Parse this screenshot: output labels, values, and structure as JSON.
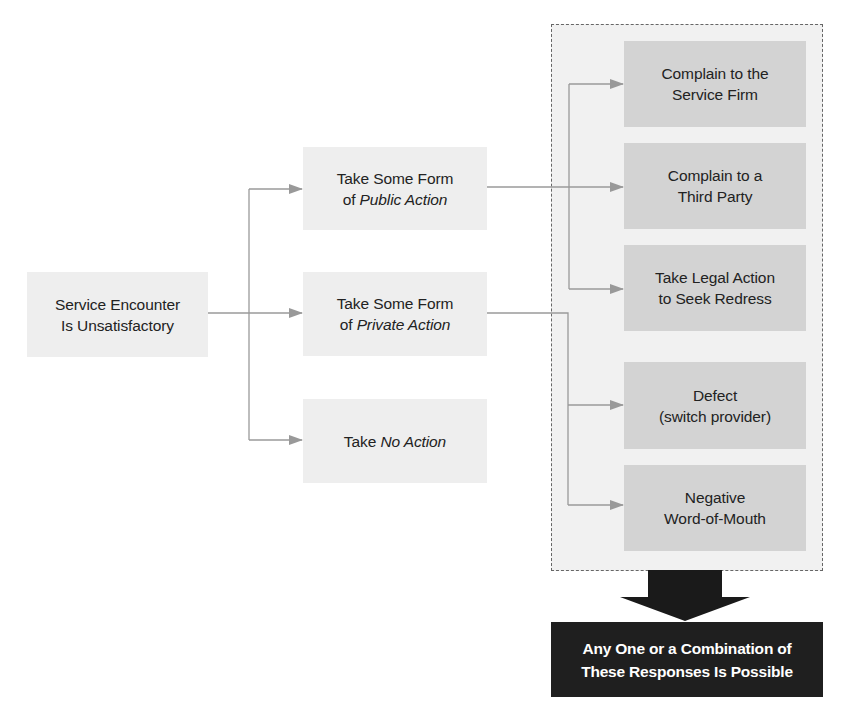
{
  "diagram": {
    "start": {
      "lines": [
        "Service Encounter",
        "Is Unsatisfactory"
      ]
    },
    "middle": [
      {
        "id": "public",
        "lines": [
          [
            "Take Some Form",
            ""
          ],
          [
            "of ",
            "Public Action"
          ]
        ]
      },
      {
        "id": "private",
        "lines": [
          [
            "Take Some Form",
            ""
          ],
          [
            "of ",
            "Private Action"
          ]
        ]
      },
      {
        "id": "none",
        "lines": [
          [
            "Take ",
            "No Action"
          ]
        ]
      }
    ],
    "responses": [
      {
        "id": "complain-firm",
        "lines": [
          "Complain to the",
          "Service Firm"
        ]
      },
      {
        "id": "complain-third-party",
        "lines": [
          "Complain to a",
          "Third Party"
        ]
      },
      {
        "id": "legal-action",
        "lines": [
          "Take Legal Action",
          "to Seek Redress"
        ]
      },
      {
        "id": "defect",
        "lines": [
          "Defect",
          "(switch provider)"
        ]
      },
      {
        "id": "negative-wom",
        "lines": [
          "Negative",
          "Word-of-Mouth"
        ]
      }
    ],
    "caption": {
      "lines": [
        "Any One or a Combination of",
        "These Responses Is Possible"
      ]
    },
    "colors": {
      "light_box": "#eeeeee",
      "response_box": "#d3d3d3",
      "container_bg": "#f1f1f1",
      "connector": "#999999",
      "caption_bg": "#1f1f1f",
      "caption_text": "#ffffff",
      "big_arrow": "#1a1a1a"
    }
  }
}
